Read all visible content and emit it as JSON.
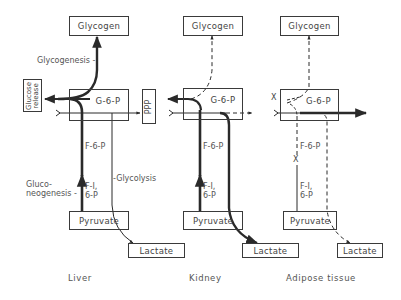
{
  "diagram": {
    "type": "metabolic-pathway-comparison",
    "panels": [
      {
        "tissue": "Liver",
        "nodes": {
          "glycogen": "Glycogen",
          "g6p": "G-6-P",
          "f6p": "F-6-P",
          "f16p_line1": "F-I,",
          "f16p_line2": "6-P",
          "pyruvate": "Pyruvate",
          "lactate": "Lactate",
          "ppp": "PPP",
          "glucose_release_line1": "Glucose",
          "glucose_release_line2": "release"
        },
        "labels": {
          "glycogenesis": "Glycogenesis -",
          "gluconeogenesis_line1": "Gluco-",
          "gluconeogenesis_line2": "neogenesis -",
          "glycolysis": "-Glycolysis"
        }
      },
      {
        "tissue": "Kidney",
        "nodes": {
          "glycogen": "Glycogen",
          "g6p": "G-6-P",
          "f6p": "F-6-P",
          "f16p_line1": "F-I,",
          "f16p_line2": "6-P",
          "pyruvate": "Pyruvate",
          "lactate": "Lactate"
        }
      },
      {
        "tissue": "Adipose tissue",
        "nodes": {
          "glycogen": "Glycogen",
          "g6p": "G-6-P",
          "f6p": "F-6-P",
          "f16p_line1": "F-I,",
          "f16p_line2": "6-P",
          "pyruvate": "Pyruvate",
          "lactate": "Lactate"
        },
        "blocked_marks": [
          "X",
          "X"
        ]
      }
    ],
    "legend_notes": {
      "thick_line": "major flux",
      "thin_line": "minor flux",
      "dashed_line": "low / negligible flux",
      "x_mark": "blocked step"
    },
    "colors": {
      "ink": "#2a2a2a",
      "text": "#444444",
      "background": "#ffffff"
    }
  }
}
